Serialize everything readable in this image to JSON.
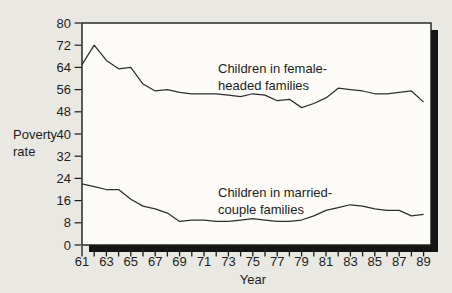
{
  "page": {
    "background": "#eae8e3"
  },
  "figure": {
    "plot_background": "#fcfbf8",
    "frame_color": "#1c1c1c",
    "shadow_color": "#141414",
    "line_color": "#2e2e2e",
    "text_color": "#1c1c1c"
  },
  "labels": {
    "ylabel_line1": "Poverty",
    "ylabel_line2": "rate",
    "xlabel": "Year",
    "series1_line1": "Children in female-",
    "series1_line2": "headed families",
    "series2_line1": "Children in married-",
    "series2_line2": "couple families"
  },
  "chart_data": {
    "type": "line",
    "title": "",
    "xlabel": "Year",
    "ylabel": "Poverty rate",
    "grid": false,
    "legend_position": "inline-annotations",
    "ylim": [
      0,
      80
    ],
    "y_ticks": [
      0,
      8,
      16,
      24,
      32,
      40,
      48,
      56,
      64,
      72,
      80
    ],
    "x": [
      1961,
      1962,
      1963,
      1964,
      1965,
      1966,
      1967,
      1968,
      1969,
      1970,
      1971,
      1972,
      1973,
      1974,
      1975,
      1976,
      1977,
      1978,
      1979,
      1980,
      1981,
      1982,
      1983,
      1984,
      1985,
      1986,
      1987,
      1988,
      1989
    ],
    "x_tick_labels": [
      "61",
      "63",
      "65",
      "67",
      "69",
      "71",
      "73",
      "75",
      "77",
      "79",
      "81",
      "83",
      "85",
      "87",
      "89"
    ],
    "series": [
      {
        "name": "Children in female-headed families",
        "values": [
          65,
          72,
          66.5,
          63.5,
          64,
          58,
          55.5,
          56,
          55,
          54.5,
          54.5,
          54.5,
          54,
          53.5,
          54.5,
          54,
          52,
          52.5,
          49.5,
          51,
          53,
          56.5,
          56,
          55.5,
          54.5,
          54.5,
          55,
          55.5,
          51.5
        ]
      },
      {
        "name": "Children in married-couple families",
        "values": [
          22,
          21,
          20,
          20,
          16.5,
          14,
          13,
          11.5,
          8.5,
          9,
          9,
          8.5,
          8.5,
          9,
          9.5,
          9,
          8.5,
          8.5,
          9,
          10.5,
          12.5,
          13.5,
          14.5,
          14,
          13,
          12.5,
          12.5,
          10.5,
          11
        ]
      }
    ]
  }
}
